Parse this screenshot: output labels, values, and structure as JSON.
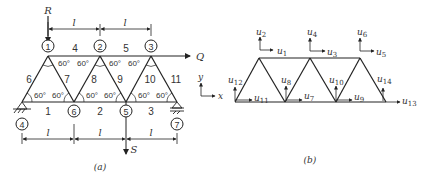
{
  "panel_a": {
    "caption": "(a)",
    "loads": {
      "R": "R",
      "Q": "Q",
      "S": "S"
    },
    "span_label": "l",
    "angle_label": "60°",
    "nodes": [
      {
        "id": "1",
        "label": "1"
      },
      {
        "id": "2",
        "label": "2"
      },
      {
        "id": "3",
        "label": "3"
      },
      {
        "id": "4",
        "label": "4"
      },
      {
        "id": "5",
        "label": "5"
      },
      {
        "id": "6",
        "label": "6"
      },
      {
        "id": "7",
        "label": "7"
      }
    ],
    "members": [
      "1",
      "2",
      "3",
      "4",
      "5",
      "6",
      "7",
      "8",
      "9",
      "10",
      "11"
    ]
  },
  "panel_b": {
    "caption": "(b)",
    "axes": {
      "x": "x",
      "y": "y"
    },
    "dofs": {
      "u1": "u",
      "u1_sub": "1",
      "u2": "u",
      "u2_sub": "2",
      "u3": "u",
      "u3_sub": "3",
      "u4": "u",
      "u4_sub": "4",
      "u5": "u",
      "u5_sub": "5",
      "u6": "u",
      "u6_sub": "6",
      "u7": "u",
      "u7_sub": "7",
      "u8": "u",
      "u8_sub": "8",
      "u9": "u",
      "u9_sub": "9",
      "u10": "u",
      "u10_sub": "10",
      "u11": "u",
      "u11_sub": "11",
      "u12": "u",
      "u12_sub": "12",
      "u13": "u",
      "u13_sub": "13",
      "u14": "u",
      "u14_sub": "14"
    }
  },
  "colors": {
    "line": "#222222",
    "text": "#333333"
  }
}
